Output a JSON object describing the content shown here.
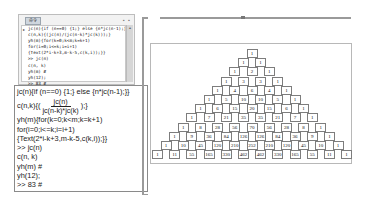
{
  "console_window": {
    "tab_label": "命令",
    "window_controls": "▪ ▪",
    "lines": [
      "jc(n){if (n==0) {1;} else {n*jc(n-1);}}",
      "c(n,k){(jc(n)/(jc(n-k)*jc(k)));}",
      "yh(m){for(k=0;k<m;k=k+1)",
      "for(i=0;i<=k;i=i+1)",
      "{Text(2*i-k+3,m-k-5,c(k,i));}}",
      ">> jc(n)",
      "c(n, k)",
      "yh(m) #",
      "yh(12);",
      ">> 83 #"
    ]
  },
  "code_view": {
    "line1": "jc(n){if (n==0) {1;} else {n*jc(n-1);}}",
    "line2_prefix": "c(n,k){(",
    "line2_numerator": "jc(n)",
    "line2_denominator": "jc(n-k)*jc(k)",
    "line2_suffix": ");}",
    "line3": "yh(m){for(k=0;k<m;k=k+1)",
    "line4": "for(i=0;i<=k;i=i+1)",
    "line5": "{Text(2*i-k+3,m-k-5,c(k,i));}}",
    "line6": ">> jc(n)",
    "line7": "c(n, k)",
    "line8": "yh(m) #",
    "line9": "yh(12);",
    "line10": ">> 83 #"
  },
  "pascal_triangle": {
    "rows": [
      [
        1
      ],
      [
        1,
        1
      ],
      [
        1,
        2,
        1
      ],
      [
        1,
        3,
        3,
        1
      ],
      [
        1,
        4,
        6,
        4,
        1
      ],
      [
        1,
        5,
        10,
        10,
        5,
        1
      ],
      [
        1,
        6,
        15,
        20,
        15,
        6,
        1
      ],
      [
        1,
        7,
        21,
        35,
        35,
        21,
        7,
        1
      ],
      [
        1,
        8,
        28,
        56,
        70,
        56,
        28,
        8,
        1
      ],
      [
        1,
        9,
        36,
        84,
        126,
        126,
        84,
        36,
        9,
        1
      ],
      [
        1,
        10,
        45,
        120,
        210,
        252,
        210,
        120,
        45,
        10,
        1
      ],
      [
        1,
        11,
        55,
        165,
        330,
        462,
        462,
        330,
        165,
        55,
        11,
        1
      ]
    ]
  },
  "colors": {
    "cell_border": "#7d7d7d",
    "frame_border": "#b8b8b8",
    "rule": "#9a9a9a"
  }
}
